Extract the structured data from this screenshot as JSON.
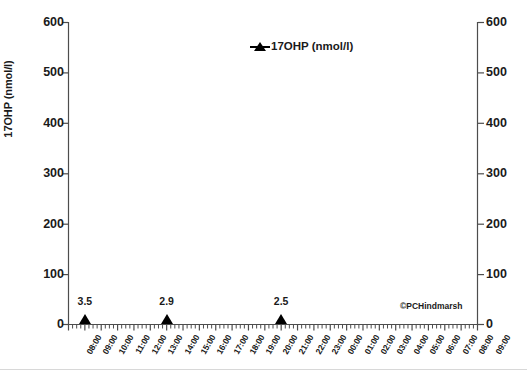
{
  "chart_data": {
    "type": "scatter",
    "title": "",
    "xlabel": "",
    "ylabel": "17OHP (nmol/l)",
    "ylabel_right": "17OHP (nmol/l)",
    "ylim": [
      0,
      600
    ],
    "ytick_step": 100,
    "yticks": [
      0,
      100,
      200,
      300,
      400,
      500,
      600
    ],
    "yticks_right": [
      0,
      100,
      200,
      300,
      400,
      500,
      600
    ],
    "grid": false,
    "legend_position": "top-center",
    "legend": [
      {
        "name": "17OHP (nmol/l)",
        "marker": "triangle",
        "color": "#000000"
      }
    ],
    "x_tick_labels": [
      "08:00",
      "09:00",
      "10:00",
      "11:00",
      "12:00",
      "13:00",
      "14:00",
      "15:00",
      "16:00",
      "17:00",
      "18:00",
      "19:00",
      "20:00",
      "21:00",
      "22:00",
      "23:00",
      "00:00",
      "01:00",
      "02:00",
      "03:00",
      "04:00",
      "05:00",
      "06:00",
      "07:00",
      "08:00",
      "09:00"
    ],
    "minor_ticks_per_interval": 4,
    "series": [
      {
        "name": "17OHP (nmol/l)",
        "x": [
          "09:00",
          "14:00",
          "21:00"
        ],
        "values": [
          3.5,
          2.9,
          2.5
        ],
        "data_labels": [
          "3.5",
          "2.9",
          "2.5"
        ]
      }
    ],
    "annotations": [
      {
        "name": "copyright",
        "text": "©PCHindmarsh"
      }
    ]
  }
}
